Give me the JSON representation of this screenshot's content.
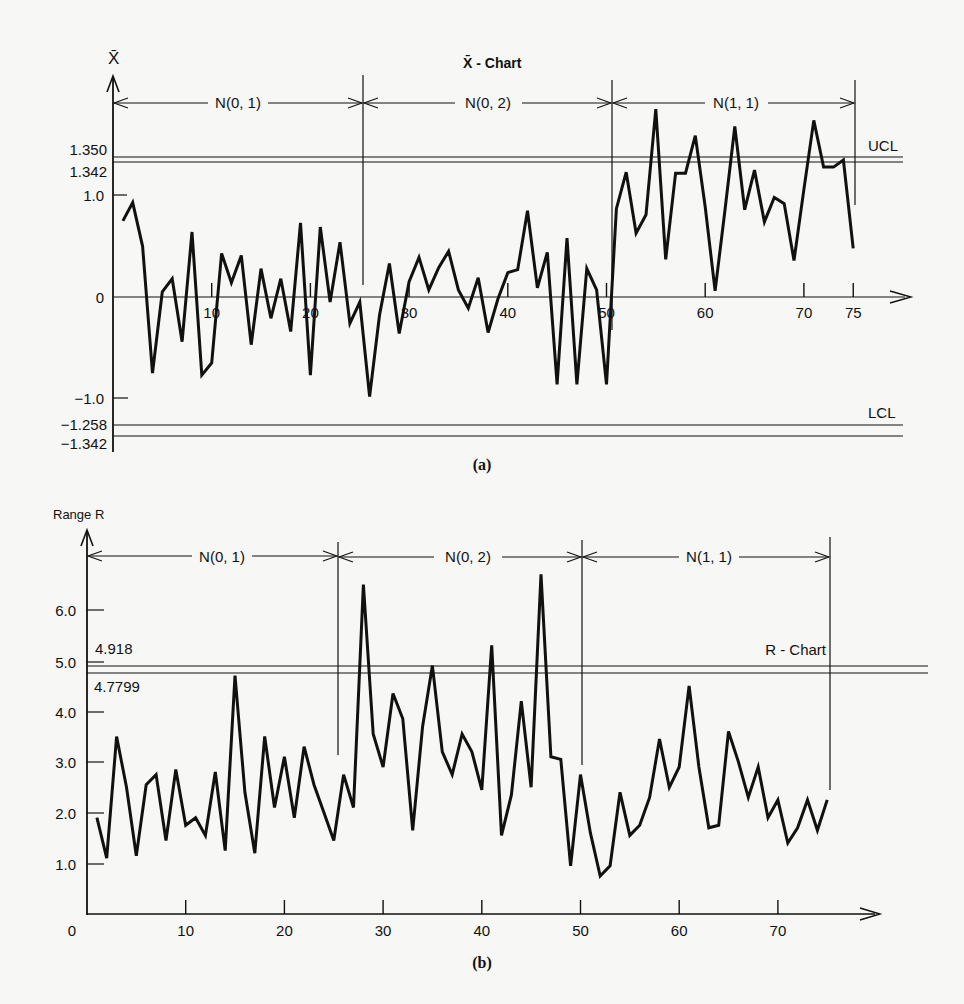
{
  "figure": {
    "panel_a": {
      "caption": "(a)",
      "title": "X̄ - Chart",
      "y_axis_label": "X̄",
      "y_ticks": [
        "1.0",
        "0",
        "−1.0"
      ],
      "control_labels": {
        "ucl_upper": "1.350",
        "ucl_lower": "1.342",
        "lcl_upper": "−1.258",
        "lcl_lower": "−1.342",
        "ucl_text": "UCL",
        "lcl_text": "LCL"
      },
      "x_ticks": [
        "10",
        "20",
        "30",
        "40",
        "50",
        "60",
        "70",
        "75"
      ],
      "segments": [
        "N(0, 1)",
        "N(0, 2)",
        "N(1, 1)"
      ]
    },
    "panel_b": {
      "caption": "(b)",
      "title": "R - Chart",
      "y_axis_label": "Range R",
      "y_ticks": [
        "6.0",
        "5.0",
        "4.0",
        "3.0",
        "2.0",
        "1.0",
        "0"
      ],
      "control_labels": {
        "upper": "4.918",
        "lower": "4.7799"
      },
      "x_ticks": [
        "10",
        "20",
        "30",
        "40",
        "50",
        "60",
        "70"
      ],
      "segments": [
        "N(0, 1)",
        "N(0, 2)",
        "N(1, 1)"
      ]
    }
  },
  "chart_data": [
    {
      "type": "line",
      "title": "X̄ - Chart",
      "xlabel": "Sample number",
      "ylabel": "X̄",
      "xlim": [
        0,
        78
      ],
      "ylim": [
        -1.4,
        1.9
      ],
      "grid": false,
      "control_limits": {
        "UCL": [
          1.35,
          1.342
        ],
        "LCL": [
          -1.258,
          -1.342
        ]
      },
      "segments": [
        {
          "label": "N(0, 1)",
          "from": 0,
          "to": 25
        },
        {
          "label": "N(0, 2)",
          "from": 25,
          "to": 50
        },
        {
          "label": "N(1, 1)",
          "from": 50,
          "to": 75
        }
      ],
      "x": [
        1,
        2,
        3,
        4,
        5,
        6,
        7,
        8,
        9,
        10,
        11,
        12,
        13,
        14,
        15,
        16,
        17,
        18,
        19,
        20,
        21,
        22,
        23,
        24,
        25,
        26,
        27,
        28,
        29,
        30,
        31,
        32,
        33,
        34,
        35,
        36,
        37,
        38,
        39,
        40,
        41,
        42,
        43,
        44,
        45,
        46,
        47,
        48,
        49,
        50,
        51,
        52,
        53,
        54,
        55,
        56,
        57,
        58,
        59,
        60,
        61,
        62,
        63,
        64,
        65,
        66,
        67,
        68,
        69,
        70,
        71,
        72,
        73,
        74,
        75
      ],
      "series": [
        {
          "name": "X̄",
          "values": [
            0.75,
            0.93,
            0.5,
            -0.75,
            0.05,
            0.18,
            -0.44,
            0.64,
            -0.77,
            -0.65,
            0.43,
            0.14,
            0.41,
            -0.47,
            0.28,
            -0.21,
            0.18,
            -0.34,
            0.73,
            -0.77,
            0.69,
            -0.05,
            0.54,
            -0.26,
            -0.05,
            -0.98,
            -0.18,
            0.33,
            -0.36,
            0.15,
            0.39,
            0.07,
            0.29,
            0.45,
            0.07,
            -0.11,
            0.19,
            -0.35,
            -0.02,
            0.24,
            0.27,
            0.85,
            0.09,
            0.44,
            -0.86,
            0.58,
            -0.86,
            0.28,
            0.07,
            -0.86,
            0.87,
            1.23,
            0.63,
            0.81,
            1.85,
            0.37,
            1.22,
            1.22,
            1.59,
            0.89,
            0.06,
            0.85,
            1.68,
            0.86,
            1.25,
            0.74,
            0.98,
            0.92,
            0.36,
            1.06,
            1.74,
            1.28,
            1.28,
            1.35,
            0.48
          ]
        }
      ]
    },
    {
      "type": "line",
      "title": "R - Chart",
      "xlabel": "Sample number",
      "ylabel": "Range R",
      "xlim": [
        0,
        80
      ],
      "ylim": [
        0,
        7.2
      ],
      "grid": false,
      "control_limits": {
        "upper": 4.918,
        "lower": 4.7799
      },
      "segments": [
        {
          "label": "N(0, 1)",
          "from": 0,
          "to": 25
        },
        {
          "label": "N(0, 2)",
          "from": 25,
          "to": 50
        },
        {
          "label": "N(1, 1)",
          "from": 50,
          "to": 75
        }
      ],
      "x": [
        1,
        2,
        3,
        4,
        5,
        6,
        7,
        8,
        9,
        10,
        11,
        12,
        13,
        14,
        15,
        16,
        17,
        18,
        19,
        20,
        21,
        22,
        23,
        24,
        25,
        26,
        27,
        28,
        29,
        30,
        31,
        32,
        33,
        34,
        35,
        36,
        37,
        38,
        39,
        40,
        41,
        42,
        43,
        44,
        45,
        46,
        47,
        48,
        49,
        50,
        51,
        52,
        53,
        54,
        55,
        56,
        57,
        58,
        59,
        60,
        61,
        62,
        63,
        64,
        65,
        66,
        67,
        68,
        69,
        70,
        71,
        72,
        73,
        74,
        75
      ],
      "series": [
        {
          "name": "R",
          "values": [
            1.9,
            1.1,
            3.5,
            2.5,
            1.15,
            2.55,
            2.75,
            1.45,
            2.85,
            1.75,
            1.9,
            1.55,
            2.8,
            1.25,
            4.7,
            2.4,
            1.2,
            3.5,
            2.1,
            3.1,
            1.9,
            3.3,
            2.55,
            2.0,
            1.45,
            2.75,
            2.1,
            6.5,
            3.55,
            2.9,
            4.35,
            3.85,
            1.65,
            3.7,
            4.9,
            3.2,
            2.75,
            3.55,
            3.2,
            2.45,
            5.3,
            1.55,
            2.35,
            4.2,
            2.5,
            6.7,
            3.1,
            3.05,
            0.95,
            2.75,
            1.6,
            0.75,
            0.95,
            2.4,
            1.55,
            1.75,
            2.3,
            3.45,
            2.5,
            2.9,
            4.5,
            2.9,
            1.7,
            1.75,
            3.6,
            3.0,
            2.3,
            2.9,
            1.9,
            2.25,
            1.4,
            1.7,
            2.25,
            1.65,
            2.25
          ]
        }
      ]
    }
  ]
}
